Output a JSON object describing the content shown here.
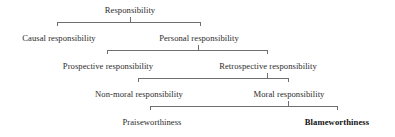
{
  "diagram": {
    "type": "hierarchy-tree",
    "line_color": "#6f6f6f",
    "text_color": "#2b2b2b",
    "emphasis_color": "#111111",
    "background": "#ffffff",
    "levels": [
      {
        "index": 0,
        "nodes": [
          {
            "label": "Responsibility",
            "emphasis": false
          }
        ]
      },
      {
        "index": 1,
        "nodes": [
          {
            "label": "Causal responsibility",
            "emphasis": false
          },
          {
            "label": "Personal responsibility",
            "emphasis": false
          }
        ]
      },
      {
        "index": 2,
        "nodes": [
          {
            "label": "Prospective responsibility",
            "emphasis": false
          },
          {
            "label": "Retrospective responsibility",
            "emphasis": false
          }
        ]
      },
      {
        "index": 3,
        "nodes": [
          {
            "label": "Non-moral responsibility",
            "emphasis": false
          },
          {
            "label": "Moral responsibility",
            "emphasis": false
          }
        ]
      },
      {
        "index": 4,
        "nodes": [
          {
            "label": "Praiseworthiness",
            "emphasis": false
          },
          {
            "label": "Blameworthiness",
            "emphasis": true
          }
        ]
      }
    ],
    "nodes": {
      "responsibility": "Responsibility",
      "causal_responsibility": "Causal responsibility",
      "personal_responsibility": "Personal responsibility",
      "prospective_responsibility": "Prospective responsibility",
      "retrospective_responsibility": "Retrospective responsibility",
      "non_moral_responsibility": "Non-moral responsibility",
      "moral_responsibility": "Moral responsibility",
      "praiseworthiness": "Praiseworthiness",
      "blameworthiness": "Blameworthiness"
    }
  }
}
